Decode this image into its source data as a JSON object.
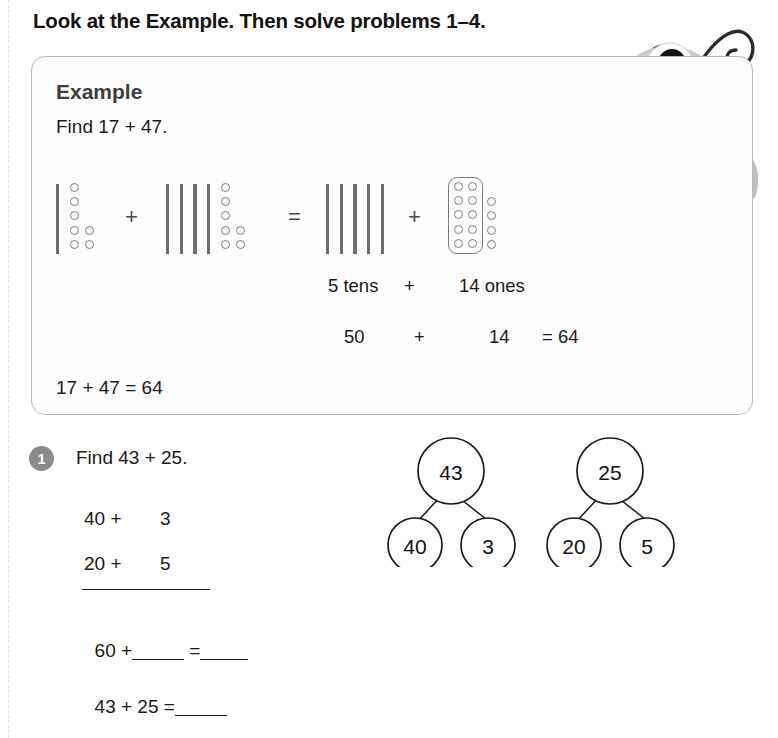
{
  "page": {
    "heading": "Look at the Example. Then solve problems 1–4."
  },
  "example": {
    "title": "Example",
    "find_text": "Find 17 + 47.",
    "blocks": {
      "group1": {
        "tens": 1,
        "ones": 7,
        "ones_columns": [
          5,
          2
        ]
      },
      "operator1": "+",
      "group2": {
        "tens": 4,
        "ones": 7,
        "ones_columns": [
          5,
          2
        ]
      },
      "operator2": "=",
      "group3": {
        "tens": 5,
        "ones": 14,
        "framed_ones": 10,
        "loose_ones": 4
      },
      "operator3": "+"
    },
    "label_row1": {
      "tens_label": "5 tens",
      "plus": "+",
      "ones_label": "14 ones"
    },
    "label_row2": {
      "tens_value": "50",
      "plus": "+",
      "ones_value": "14",
      "equals_result": "= 64"
    },
    "final_equation": "17 + 47 = 64"
  },
  "problem1": {
    "number": "1",
    "prompt": "Find 43 + 25.",
    "addend1_tens": "40 +",
    "addend1_ones": "3",
    "addend2_tens": "20 +",
    "addend2_ones": "5",
    "sum_line_prefix": "60 +",
    "sum_line_equals": "=",
    "answer_line_prefix": "43 + 25 =",
    "bond_left": {
      "whole": "43",
      "part1": "40",
      "part2": "3"
    },
    "bond_right": {
      "whole": "25",
      "part1": "20",
      "part2": "5"
    }
  },
  "illustration": {
    "character": "one-eyed-monster"
  },
  "colors": {
    "card_border": "#b9b9b9",
    "badge": "#8a8a8a",
    "block_gray": "#6d6d6d",
    "monster_body": "#c9c9c9",
    "text": "#1a1a1a"
  }
}
